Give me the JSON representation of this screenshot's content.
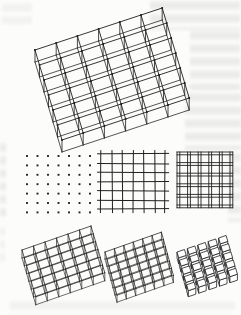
{
  "page": {
    "kind": "scanned book figure",
    "paper_color": "#fcfcfa",
    "ink_color": "#1f1f1f",
    "bleedthrough_color": "#949494"
  },
  "figure": {
    "panels": [
      {
        "id": "large-space-grid",
        "type": "space-grid",
        "label": "large axonometric double-layer grid structure",
        "cols": 6,
        "rows": 6,
        "origin": [
          35,
          50
        ],
        "u": [
          21.2,
          -7.0
        ],
        "v": [
          4.5,
          15.0
        ],
        "h": 12,
        "stroke": 0.9,
        "dots": true,
        "dot_r": 1.0
      },
      {
        "id": "dot-grid-plan",
        "type": "dot-grid",
        "label": "plan pattern: grid of node points",
        "cols": 7,
        "rows": 7,
        "origin": [
          27,
          156
        ],
        "sx": 10.5,
        "sy": 9.4,
        "dot": 1.9
      },
      {
        "id": "line-grid-plan",
        "type": "line-grid",
        "label": "plan pattern: single-line square grid",
        "cols": 6,
        "rows": 6,
        "origin": [
          101,
          154
        ],
        "sx": 10.7,
        "sy": 9.2,
        "overhang": 3.5,
        "stroke": 1.0
      },
      {
        "id": "double-line-grid-plan",
        "type": "double-line-grid",
        "label": "plan pattern: double-line (beam) grid",
        "cols": 5,
        "rows": 5,
        "origin": [
          177,
          152
        ],
        "pitch": 10.6,
        "gap": 2.8,
        "stroke": 0.9
      },
      {
        "id": "small-space-grid-left",
        "type": "space-grid",
        "label": "small axonometric double-layer grid, left",
        "cols": 6,
        "rows": 6,
        "origin": [
          22,
          250
        ],
        "u": [
          11.5,
          -4.0
        ],
        "v": [
          2.3,
          7.8
        ],
        "h": 8,
        "stroke": 0.75,
        "dots": false,
        "dot_r": 0
      },
      {
        "id": "small-space-grid-middle",
        "type": "space-grid",
        "label": "small axonometric double-layer grid, middle",
        "cols": 6,
        "rows": 6,
        "origin": [
          105,
          252
        ],
        "u": [
          9.4,
          -3.3
        ],
        "v": [
          2.0,
          7.2
        ],
        "h": 7,
        "stroke": 0.75,
        "dots": false,
        "dot_r": 0
      },
      {
        "id": "cube-grid",
        "type": "cube-grid",
        "label": "small axonometric waffle of cubes, right",
        "cols": 5,
        "rows": 5,
        "origin": [
          177,
          252
        ],
        "u": [
          10.4,
          -3.5
        ],
        "v": [
          2.4,
          8.2
        ],
        "h": 6,
        "cube": 0.72,
        "stroke": 0.8
      }
    ]
  },
  "bleedthrough_regions": [
    {
      "id": "top-left",
      "x": 2,
      "y": 2,
      "w": 30,
      "h": 22,
      "light": true
    },
    {
      "id": "top-right",
      "x": 150,
      "y": 0,
      "w": 90,
      "h": 30,
      "light": false
    },
    {
      "id": "right-upper",
      "x": 190,
      "y": 30,
      "w": 50,
      "h": 60,
      "light": false
    },
    {
      "id": "right-lower",
      "x": 185,
      "y": 92,
      "w": 56,
      "h": 58,
      "light": false
    },
    {
      "id": "right-mid",
      "x": 228,
      "y": 152,
      "w": 13,
      "h": 70,
      "light": false
    },
    {
      "id": "left-mid",
      "x": 0,
      "y": 142,
      "w": 6,
      "h": 75,
      "light": false
    },
    {
      "id": "left-lower",
      "x": 0,
      "y": 226,
      "w": 5,
      "h": 40,
      "light": true
    },
    {
      "id": "bottom",
      "x": 10,
      "y": 300,
      "w": 225,
      "h": 15,
      "light": true
    }
  ]
}
